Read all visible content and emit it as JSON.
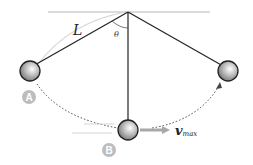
{
  "diagram": {
    "labels": {
      "length": "L",
      "angle": "θ",
      "point_a": "A",
      "point_b": "B",
      "velocity": "v",
      "velocity_sub": "max"
    },
    "colors": {
      "string": "#222222",
      "ceiling": "#cfcfcf",
      "path": "#444444",
      "badge": "#bdbdbd",
      "arrow": "#a8a8a8"
    }
  }
}
